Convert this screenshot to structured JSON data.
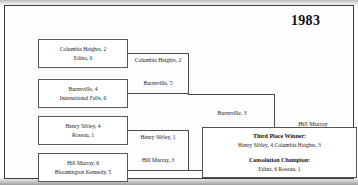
{
  "bracket": {
    "year": "1983",
    "round1": [
      {
        "top": "Columbia Heights, 2",
        "bottom": "Edina, 0"
      },
      {
        "top": "Burnsville, 4",
        "bottom": "International Falls, 0"
      },
      {
        "top": "Henry Sibley, 4",
        "bottom": "Roseau, 1"
      },
      {
        "top": "Hill Murray, 6",
        "bottom": "Bloomington Kennedy, 5"
      }
    ],
    "round2": [
      {
        "top": "Columbia Heights, 2",
        "bottom": "Burnsville, 5"
      },
      {
        "top": "Henry Sibley, 1",
        "bottom": "Hill Murray, 3"
      }
    ],
    "round3": [
      {
        "top": "Burnsville, 3",
        "bottom": "Hill Murray, 4"
      }
    ],
    "champion": {
      "name": "Hill Murray",
      "title": "State Champion"
    },
    "extras": {
      "third_place_label": "Third Place Winner:",
      "third_place_result": "Henry Sibley, 4  Columbia Heights, 3",
      "consolation_label": "Consolation Champion:",
      "consolation_result": "Edina, 6  Roseau, 1"
    }
  }
}
